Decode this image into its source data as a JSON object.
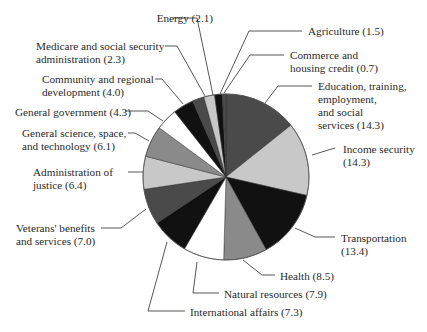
{
  "chart_data": {
    "type": "pie",
    "title": "",
    "start_angle_deg": 0,
    "direction": "clockwise",
    "slices": [
      {
        "label": "Education, training, employment, and social services",
        "value": 14.3,
        "color": "#4a4a4a"
      },
      {
        "label": "Income security",
        "value": 14.3,
        "color": "#c8c8c8"
      },
      {
        "label": "Transportation",
        "value": 13.4,
        "color": "#111111"
      },
      {
        "label": "Health",
        "value": 8.5,
        "color": "#8a8a8a"
      },
      {
        "label": "Natural resources",
        "value": 7.9,
        "color": "#ffffff"
      },
      {
        "label": "International affairs",
        "value": 7.3,
        "color": "#111111"
      },
      {
        "label": "Veterans' benefits and services",
        "value": 7.0,
        "color": "#4a4a4a"
      },
      {
        "label": "Administration of justice",
        "value": 6.4,
        "color": "#c8c8c8"
      },
      {
        "label": "General science, space, and technology",
        "value": 6.1,
        "color": "#8a8a8a"
      },
      {
        "label": "General government",
        "value": 4.3,
        "color": "#ffffff"
      },
      {
        "label": "Community and regional development",
        "value": 4.0,
        "color": "#111111"
      },
      {
        "label": "Medicare and social security administration",
        "value": 2.3,
        "color": "#4a4a4a"
      },
      {
        "label": "Energy",
        "value": 2.1,
        "color": "#c8c8c8"
      },
      {
        "label": "Agriculture",
        "value": 1.5,
        "color": "#111111"
      },
      {
        "label": "Commerce and housing credit",
        "value": 0.7,
        "color": "#4a4a4a"
      }
    ],
    "legend": "none (leader-line labels)",
    "center": [
      226,
      177
    ],
    "radius": 83
  },
  "labels": [
    {
      "id": "energy",
      "text": "Energy (2.1)",
      "x": 103,
      "y": 12,
      "align": "right",
      "w": 110
    },
    {
      "id": "agriculture",
      "text": "Agriculture (1.5)",
      "x": 308,
      "y": 25,
      "align": "left"
    },
    {
      "id": "medicare",
      "text": "Medicare and social security\nadministration (2.3)",
      "x": 36,
      "y": 40,
      "align": "left"
    },
    {
      "id": "commerce",
      "text": "Commerce and\nhousing credit (0.7)",
      "x": 290,
      "y": 49,
      "align": "left"
    },
    {
      "id": "community",
      "text": "Community and regional\ndevelopment (4.0)",
      "x": 42,
      "y": 73,
      "align": "left"
    },
    {
      "id": "education",
      "text": "Education, training,\nemployment,\nand social\nservices (14.3)",
      "x": 318,
      "y": 80,
      "align": "left"
    },
    {
      "id": "general_government",
      "text": "General government (4.3)",
      "x": 15,
      "y": 106,
      "align": "left"
    },
    {
      "id": "general_science",
      "text": "General science, space,\nand technology (6.1)",
      "x": 22,
      "y": 127,
      "align": "left"
    },
    {
      "id": "income_security",
      "text": "Income security\n(14.3)",
      "x": 343,
      "y": 143,
      "align": "left"
    },
    {
      "id": "administration_justice",
      "text": "Administration of\njustice (6.4)",
      "x": 33,
      "y": 166,
      "align": "left"
    },
    {
      "id": "veterans",
      "text": "Veterans' benefits\nand services (7.0)",
      "x": 16,
      "y": 222,
      "align": "left"
    },
    {
      "id": "transportation",
      "text": "Transportation\n(13.4)",
      "x": 341,
      "y": 232,
      "align": "left"
    },
    {
      "id": "health",
      "text": "Health (8.5)",
      "x": 280,
      "y": 270,
      "align": "left"
    },
    {
      "id": "natural_resources",
      "text": "Natural resources (7.9)",
      "x": 224,
      "y": 288,
      "align": "left"
    },
    {
      "id": "international_affairs",
      "text": "International affairs (7.3)",
      "x": 190,
      "y": 306,
      "align": "left"
    }
  ],
  "leaders": [
    {
      "id": "energy",
      "points": [
        [
          173,
          18
        ],
        [
          197,
          18
        ],
        [
          213,
          95
        ]
      ]
    },
    {
      "id": "agriculture",
      "points": [
        [
          302,
          31
        ],
        [
          249,
          31
        ],
        [
          220,
          94
        ]
      ]
    },
    {
      "id": "medicare",
      "points": [
        [
          165,
          46
        ],
        [
          177,
          46
        ],
        [
          205,
          96
        ]
      ]
    },
    {
      "id": "commerce",
      "points": [
        [
          284,
          55
        ],
        [
          250,
          55
        ],
        [
          224,
          93
        ]
      ]
    },
    {
      "id": "community",
      "points": [
        [
          155,
          79
        ],
        [
          162,
          79
        ],
        [
          183,
          104
        ]
      ]
    },
    {
      "id": "education",
      "points": [
        [
          312,
          86
        ],
        [
          278,
          86
        ],
        [
          265,
          103
        ]
      ]
    },
    {
      "id": "general_government",
      "points": [
        [
          125,
          111
        ],
        [
          148,
          111
        ],
        [
          163,
          121
        ]
      ]
    },
    {
      "id": "general_science",
      "points": [
        [
          128,
          133
        ],
        [
          135,
          133
        ],
        [
          149,
          141
        ]
      ]
    },
    {
      "id": "income_security",
      "points": [
        [
          335,
          148
        ],
        [
          312,
          155
        ]
      ]
    },
    {
      "id": "administration_justice",
      "points": [
        [
          128,
          172
        ],
        [
          143,
          172
        ]
      ]
    },
    {
      "id": "veterans",
      "points": [
        [
          101,
          228
        ],
        [
          121,
          228
        ],
        [
          146,
          209
        ]
      ]
    },
    {
      "id": "transportation",
      "points": [
        [
          335,
          237
        ],
        [
          315,
          237
        ],
        [
          295,
          228
        ]
      ]
    },
    {
      "id": "health",
      "points": [
        [
          275,
          275
        ],
        [
          262,
          275
        ],
        [
          243,
          260
        ]
      ]
    },
    {
      "id": "natural_resources",
      "points": [
        [
          219,
          293
        ],
        [
          193,
          293
        ],
        [
          197,
          262
        ]
      ]
    },
    {
      "id": "international_affairs",
      "points": [
        [
          185,
          311
        ],
        [
          148,
          311
        ],
        [
          167,
          242
        ]
      ]
    }
  ]
}
